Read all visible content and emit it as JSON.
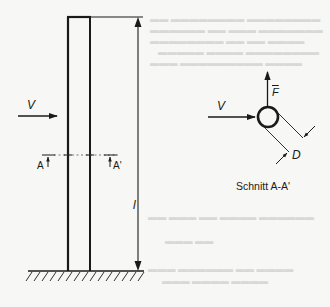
{
  "figure": {
    "type": "technical-diagram",
    "colors": {
      "ink": "#1a1a1a",
      "paper": "#f7f7f5",
      "show_through": "#d8d8d6"
    }
  },
  "side_view": {
    "velocity_label": "V",
    "length_label": "l",
    "section_marker_left": "A",
    "section_marker_right": "A'"
  },
  "cross_section": {
    "velocity_label": "V",
    "force_label": "F",
    "diameter_label": "D",
    "caption": "Schnitt A-A'"
  }
}
